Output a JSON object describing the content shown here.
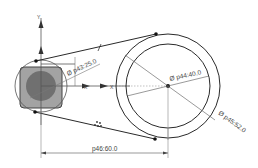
{
  "sketch": {
    "axis_y_label": "Y",
    "axis_x_label": "X",
    "dimensions": {
      "small_circle": "Ø p43:25.0",
      "inner_circle": "Ø p44:40.0",
      "outer_circle": "Ø p45:52.0",
      "center_distance": "p46:60.0"
    },
    "constraint_tangent_label": "/"
  },
  "colors": {
    "line": "#2a2a2a",
    "dim": "#555555",
    "square_fill": "#9a9a9a",
    "circle_fill": "#6e6e6e",
    "construction": "#888888"
  }
}
